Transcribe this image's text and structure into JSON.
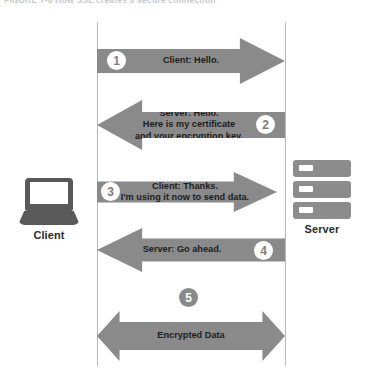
{
  "caption": {
    "text": "FIGURE 7-6  How SSL creates a secure connection"
  },
  "diagram": {
    "colors": {
      "arrow": "#8a8a8a",
      "node": "#595959",
      "rack": "#8c8c8c",
      "lifeline": "#b9b9b9",
      "text": "#1d1d1d",
      "badge_text": "#7d7d7d"
    },
    "nodes": [
      {
        "id": "client",
        "label": "Client",
        "icon": "laptop-icon"
      },
      {
        "id": "server",
        "label": "Server",
        "icon": "server-rack-icon"
      }
    ],
    "messages": [
      {
        "step": "1",
        "direction": "right",
        "from": "client",
        "to": "server",
        "text": "Client: Hello.",
        "badge_style": "on-arrow"
      },
      {
        "step": "2",
        "direction": "left",
        "from": "server",
        "to": "client",
        "text": "Server: Hello.\nHere is my certificate\nand your encryption key.",
        "badge_style": "on-arrow"
      },
      {
        "step": "3",
        "direction": "right",
        "from": "client",
        "to": "server",
        "text": "Client: Thanks.\nI'm using it now to send data.",
        "badge_style": "on-arrow"
      },
      {
        "step": "4",
        "direction": "left",
        "from": "server",
        "to": "client",
        "text": "Server: Go ahead.",
        "badge_style": "on-arrow"
      },
      {
        "step": "5",
        "direction": "both",
        "from": "client",
        "to": "server",
        "text": "Encrypted Data",
        "badge_style": "above-arrow-inverted"
      }
    ]
  }
}
